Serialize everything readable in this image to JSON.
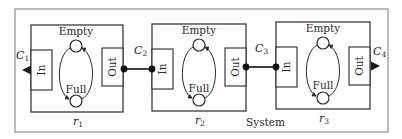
{
  "diagram": {
    "system_label": "System",
    "state_labels": {
      "top": "Empty",
      "bottom": "Full"
    },
    "port_labels": {
      "in": "In",
      "out": "Out"
    },
    "modules": [
      {
        "id": "r1",
        "label_base": "r",
        "label_sub": "1"
      },
      {
        "id": "r2",
        "label_base": "r",
        "label_sub": "2"
      },
      {
        "id": "r3",
        "label_base": "r",
        "label_sub": "3"
      }
    ],
    "channels": [
      {
        "id": "C1",
        "label_base": "C",
        "label_sub": "1",
        "type": "external-output-left"
      },
      {
        "id": "C2",
        "label_base": "C",
        "label_sub": "2",
        "type": "link r1.Out -> r2.In"
      },
      {
        "id": "C3",
        "label_base": "C",
        "label_sub": "3",
        "type": "link r2.Out -> r3.In"
      },
      {
        "id": "C4",
        "label_base": "C",
        "label_sub": "4",
        "type": "external-output-right"
      }
    ],
    "colors": {
      "stroke": "#2a2a2a",
      "frame": "#6a6a6a",
      "background": "#ffffff"
    }
  }
}
